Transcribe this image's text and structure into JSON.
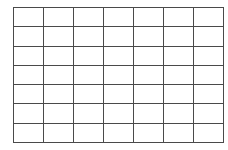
{
  "grid": {
    "rows": 7,
    "columns": 7,
    "line_color": "#4a4a4a",
    "background_color": "#ffffff",
    "cells": [
      [
        "",
        "",
        "",
        "",
        "",
        "",
        ""
      ],
      [
        "",
        "",
        "",
        "",
        "",
        "",
        ""
      ],
      [
        "",
        "",
        "",
        "",
        "",
        "",
        ""
      ],
      [
        "",
        "",
        "",
        "",
        "",
        "",
        ""
      ],
      [
        "",
        "",
        "",
        "",
        "",
        "",
        ""
      ],
      [
        "",
        "",
        "",
        "",
        "",
        "",
        ""
      ],
      [
        "",
        "",
        "",
        "",
        "",
        "",
        ""
      ]
    ]
  }
}
